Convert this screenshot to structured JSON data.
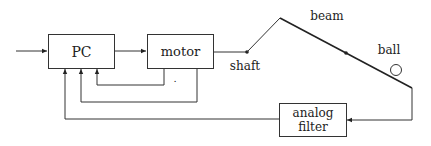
{
  "diagram": {
    "title": "",
    "blocks": {
      "pc": {
        "label": "PC"
      },
      "motor": {
        "label": "motor"
      },
      "filter": {
        "line1": "analog",
        "line2": "filter"
      }
    },
    "labels": {
      "shaft": "shaft",
      "beam": "beam",
      "ball": "ball",
      "dot_mark": "."
    },
    "connections": [
      {
        "from": "input",
        "to": "PC"
      },
      {
        "from": "PC",
        "to": "motor"
      },
      {
        "from": "motor",
        "to": "shaft"
      },
      {
        "from": "shaft",
        "to": "beam"
      },
      {
        "from": "beam",
        "to": "analog filter"
      },
      {
        "from": "analog filter",
        "to": "PC"
      },
      {
        "from": "motor",
        "to": "PC",
        "note": "feedback 1"
      },
      {
        "from": "motor",
        "to": "PC",
        "note": "feedback 2"
      }
    ],
    "colors": {
      "stroke": "#333333",
      "background": "#ffffff"
    }
  }
}
